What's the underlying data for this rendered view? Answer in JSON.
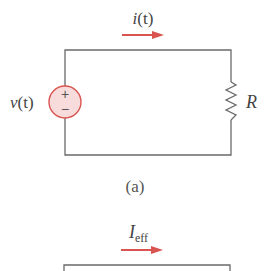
{
  "figure_a": {
    "current_label": "i",
    "current_arg": "(t)",
    "source_label": "v",
    "source_arg": "(t)",
    "source_plus": "+",
    "source_minus": "−",
    "resistor_label": "R",
    "caption": "(a)"
  },
  "figure_b": {
    "current_label": "I",
    "current_subscript": "eff"
  },
  "colors": {
    "arrow": "#d9534f",
    "source_fill": "#f8dcdc",
    "source_stroke": "#d9534f",
    "wire": "#6a6a6a"
  }
}
